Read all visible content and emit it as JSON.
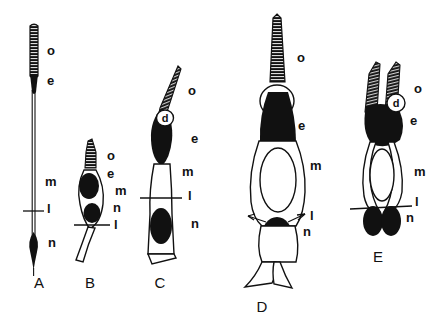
{
  "figure": {
    "background_color": "#ffffff",
    "ink_color": "#111111",
    "width": 436,
    "height": 330
  },
  "part_key": {
    "o": "acrosome",
    "e": "nucleus-anterior-dense-region",
    "m": "midpiece",
    "l": "annulus-level-marker",
    "n": "nucleus",
    "d": "dense-body-vesicle"
  },
  "panels": [
    {
      "id": "A",
      "letter": "A",
      "letter_x": 39,
      "letter_y": 288,
      "labels": [
        {
          "text": "o",
          "x": 47,
          "y": 55
        },
        {
          "text": "e",
          "x": 47,
          "y": 85
        },
        {
          "text": "m",
          "x": 45,
          "y": 186
        },
        {
          "text": "l",
          "x": 47,
          "y": 213
        },
        {
          "text": "n",
          "x": 48,
          "y": 247
        }
      ]
    },
    {
      "id": "B",
      "letter": "B",
      "letter_x": 90,
      "letter_y": 288,
      "labels": [
        {
          "text": "o",
          "x": 107,
          "y": 160
        },
        {
          "text": "e",
          "x": 107,
          "y": 178
        },
        {
          "text": "m",
          "x": 115,
          "y": 195
        },
        {
          "text": "n",
          "x": 113,
          "y": 212
        },
        {
          "text": "l",
          "x": 114,
          "y": 229
        }
      ]
    },
    {
      "id": "C",
      "letter": "C",
      "letter_x": 160,
      "letter_y": 288,
      "labels": [
        {
          "text": "o",
          "x": 188,
          "y": 95
        },
        {
          "text": "d",
          "x": 169,
          "y": 121
        },
        {
          "text": "e",
          "x": 191,
          "y": 143
        },
        {
          "text": "m",
          "x": 182,
          "y": 176
        },
        {
          "text": "l",
          "x": 188,
          "y": 200
        },
        {
          "text": "n",
          "x": 191,
          "y": 228
        }
      ]
    },
    {
      "id": "D",
      "letter": "D",
      "letter_x": 262,
      "letter_y": 312,
      "labels": [
        {
          "text": "o",
          "x": 297,
          "y": 62
        },
        {
          "text": "d",
          "x": 278,
          "y": 106
        },
        {
          "text": "e",
          "x": 298,
          "y": 130
        },
        {
          "text": "m",
          "x": 310,
          "y": 170
        },
        {
          "text": "l",
          "x": 310,
          "y": 220
        },
        {
          "text": "n",
          "x": 303,
          "y": 236
        }
      ]
    },
    {
      "id": "E",
      "letter": "E",
      "letter_x": 378,
      "letter_y": 262,
      "labels": [
        {
          "text": "o",
          "x": 414,
          "y": 93
        },
        {
          "text": "d",
          "x": 397,
          "y": 105
        },
        {
          "text": "e",
          "x": 410,
          "y": 125
        },
        {
          "text": "m",
          "x": 414,
          "y": 176
        },
        {
          "text": "l",
          "x": 415,
          "y": 206
        },
        {
          "text": "n",
          "x": 406,
          "y": 222
        }
      ]
    }
  ]
}
